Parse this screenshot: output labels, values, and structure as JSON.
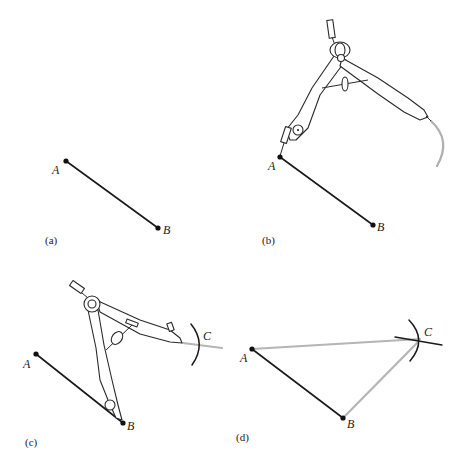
{
  "figure": {
    "colors": {
      "ink": "#1a1a1a",
      "construction_gray": "#b5b5b5",
      "background": "#ffffff"
    },
    "panels": [
      {
        "id": "a",
        "label": "(a)",
        "points": {
          "A": {
            "label": "A",
            "x": 66,
            "y": 161
          },
          "B": {
            "label": "B",
            "x": 158,
            "y": 228
          }
        },
        "segments": [
          "AB"
        ],
        "compass": false
      },
      {
        "id": "b",
        "label": "(b)",
        "points": {
          "A": {
            "label": "A",
            "x": 280,
            "y": 157
          },
          "B": {
            "label": "B",
            "x": 373,
            "y": 225
          }
        },
        "segments": [
          "AB"
        ],
        "compass": true,
        "compass_center": "A",
        "arc": "gray arc drawn from compass pencil tip"
      },
      {
        "id": "c",
        "label": "(c)",
        "points": {
          "A": {
            "label": "A",
            "x": 36,
            "y": 354
          },
          "B": {
            "label": "B",
            "x": 123,
            "y": 423
          },
          "C": {
            "label": "C",
            "x": 200,
            "y": 343
          }
        },
        "segments": [
          "AB"
        ],
        "compass": true,
        "compass_center": "B",
        "arc": "dark arc crossing the gray arc at C"
      },
      {
        "id": "d",
        "label": "(d)",
        "points": {
          "A": {
            "label": "A",
            "x": 252,
            "y": 349
          },
          "B": {
            "label": "B",
            "x": 343,
            "y": 418
          },
          "C": {
            "label": "C",
            "x": 420,
            "y": 339
          }
        },
        "segments": [
          "AB",
          "AC",
          "BC"
        ],
        "compass": false
      }
    ]
  }
}
